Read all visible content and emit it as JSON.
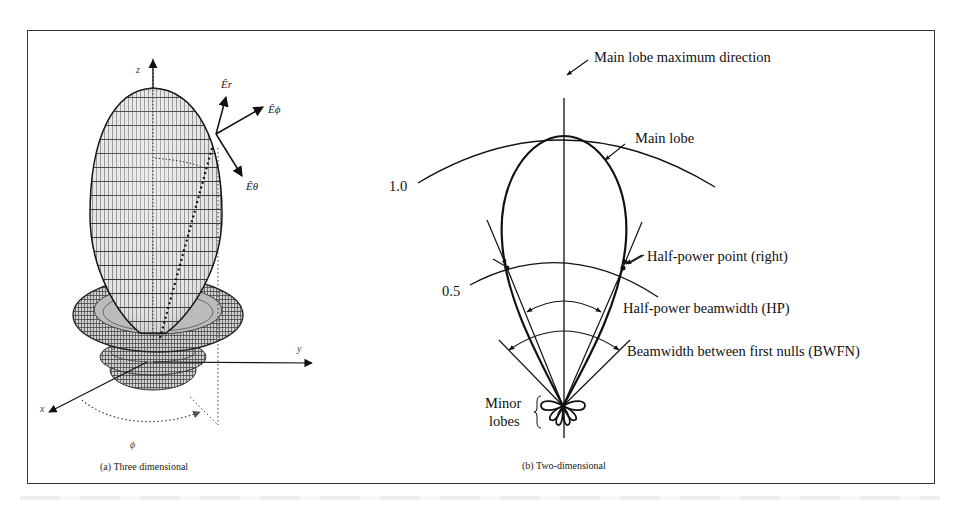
{
  "figure": {
    "panels": [
      {
        "id": "a",
        "caption": "(a) Three dimensional",
        "axes": {
          "z": "z",
          "y": "y",
          "x": "x",
          "phi": "ϕ"
        },
        "field_vectors": [
          {
            "name": "E_r",
            "label": "Êr"
          },
          {
            "name": "E_phi",
            "label": "Êϕ"
          },
          {
            "name": "E_theta",
            "label": "Êθ"
          }
        ]
      },
      {
        "id": "b",
        "caption": "(b) Two-dimensional",
        "level_labels": [
          "1.0",
          "0.5"
        ],
        "annotations": [
          "Main lobe maximum direction",
          "Main lobe",
          "Half-power point (right)",
          "Half-power beamwidth (HP)",
          "Beamwidth between first nulls (BWFN)"
        ],
        "minor_lobes_label": [
          "Minor",
          "lobes"
        ]
      }
    ]
  },
  "colors": {
    "ink": "#111111",
    "frame": "#333333",
    "surface_light": "#d8d8d8",
    "surface_dark": "#1a1a1a"
  }
}
